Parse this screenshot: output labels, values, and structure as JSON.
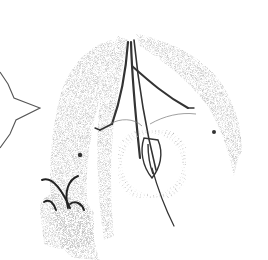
{
  "image": {
    "description": "Monochrome stippled scientific engraving of a cone-like organism with branching central stalks, a radiating circular disc, a claw-like appendage at lower left, and a partial outline at the left edge",
    "colors": {
      "background": "#ffffff",
      "stipple": "#9a9a9a",
      "ink": "#3a3a3a",
      "dark": "#222222"
    }
  }
}
